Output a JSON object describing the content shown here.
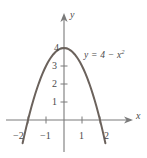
{
  "figure": {
    "background_color": "#ffffff",
    "curve_color": "#6b625c",
    "axis_color": "#7a7a7a",
    "text_color": "#4a4a4a"
  },
  "axes": {
    "x_name": "x",
    "y_name": "y",
    "origin_px": {
      "x": 64,
      "y": 120
    },
    "unit_px": 18
  },
  "labels": {
    "equation_lead": "y = 4 − x",
    "equation_exponent": "2",
    "equation_full": "y = 4 − x²"
  },
  "chart_data": {
    "type": "line",
    "title": "",
    "subtitle": "",
    "xlabel": "x",
    "ylabel": "y",
    "equation": "y = 4 - x^2",
    "grid": false,
    "legend": "none",
    "annotations": [
      {
        "text": "y = 4 − x²",
        "x": 1.2,
        "y": 3.85
      }
    ],
    "xlim": [
      -2.6,
      3.7
    ],
    "ylim": [
      -1.8,
      4.9
    ],
    "xticks": [
      -2,
      -1,
      1,
      2
    ],
    "xticklabels": [
      "−2",
      "−1",
      "1",
      "2"
    ],
    "yticks": [
      1,
      2,
      3,
      4
    ],
    "yticklabels": [
      "1",
      "2",
      "3",
      "4"
    ],
    "vertex": {
      "x": 0,
      "y": 4
    },
    "roots": [
      -2,
      2
    ],
    "series": [
      {
        "name": "y = 4 − x²",
        "color": "#6b625c",
        "x": [
          -2.3,
          -2.2,
          -2.1,
          -2.0,
          -1.9,
          -1.8,
          -1.7,
          -1.6,
          -1.5,
          -1.4,
          -1.3,
          -1.2,
          -1.1,
          -1.0,
          -0.9,
          -0.8,
          -0.7,
          -0.6,
          -0.5,
          -0.4,
          -0.3,
          -0.2,
          -0.1,
          0.0,
          0.1,
          0.2,
          0.3,
          0.4,
          0.5,
          0.6,
          0.7,
          0.8,
          0.9,
          1.0,
          1.1,
          1.2,
          1.3,
          1.4,
          1.5,
          1.6,
          1.7,
          1.8,
          1.9,
          2.0,
          2.1,
          2.2,
          2.3
        ],
        "y": [
          -1.29,
          -0.84,
          -0.41,
          0.0,
          0.39,
          0.76,
          1.11,
          1.44,
          1.75,
          2.04,
          2.31,
          2.56,
          2.79,
          3.0,
          3.19,
          3.36,
          3.51,
          3.64,
          3.75,
          3.84,
          3.91,
          3.96,
          3.99,
          4.0,
          3.99,
          3.96,
          3.91,
          3.84,
          3.75,
          3.64,
          3.51,
          3.36,
          3.19,
          3.0,
          2.79,
          2.56,
          2.31,
          2.04,
          1.75,
          1.44,
          1.11,
          0.76,
          0.39,
          0.0,
          -0.41,
          -0.84,
          -1.29
        ]
      }
    ]
  },
  "y_tick_labels": [
    {
      "value": 4,
      "text": "4"
    },
    {
      "value": 3,
      "text": "3"
    },
    {
      "value": 2,
      "text": "2"
    },
    {
      "value": 1,
      "text": "1"
    }
  ],
  "x_tick_labels": [
    {
      "value": -2,
      "text": "−2"
    },
    {
      "value": -1,
      "text": "−1"
    },
    {
      "value": 1,
      "text": "1"
    },
    {
      "value": 2,
      "text": "2"
    }
  ]
}
